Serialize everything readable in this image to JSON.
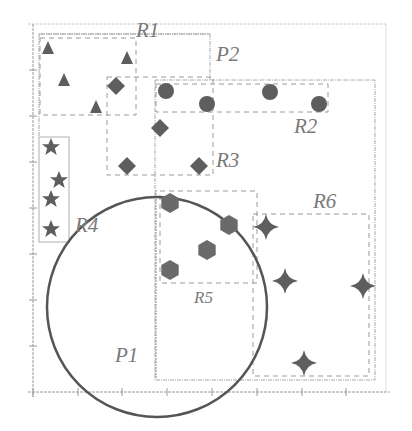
{
  "diagram": {
    "type": "spatial-partition",
    "colors": {
      "shape_fill": "#5e5e5e",
      "circle_stroke": "#555555",
      "dashed": "#9a9a9a",
      "axis": "#9a9a9a",
      "label": "#7a7a7a"
    },
    "labels": {
      "R1": "R1",
      "R2": "R2",
      "R3": "R3",
      "R4": "R4",
      "R5": "R5",
      "R6": "R6",
      "P1": "P1",
      "P2": "P2"
    },
    "regions": [
      {
        "id": "R1",
        "x": 40,
        "y": 38,
        "w": 96,
        "h": 77,
        "shape": "triangle"
      },
      {
        "id": "R2",
        "x": 156,
        "y": 84,
        "w": 172,
        "h": 28,
        "shape": "circle"
      },
      {
        "id": "R3",
        "x": 107,
        "y": 77,
        "w": 106,
        "h": 98,
        "shape": "diamond"
      },
      {
        "id": "R4",
        "x": 39,
        "y": 137,
        "w": 30,
        "h": 105,
        "shape": "star"
      },
      {
        "id": "R5",
        "x": 160,
        "y": 191,
        "w": 97,
        "h": 92,
        "shape": "hexagon"
      },
      {
        "id": "R6",
        "x": 253,
        "y": 214,
        "w": 116,
        "h": 162,
        "shape": "sparkle"
      }
    ],
    "partitions": [
      {
        "id": "P1",
        "shape": "circle",
        "cx": 157,
        "cy": 307,
        "r": 110
      },
      {
        "id": "P2",
        "x": 155,
        "y": 80,
        "w": 220,
        "h": 300
      }
    ],
    "points": {
      "triangles": [
        [
          48,
          47
        ],
        [
          64,
          80
        ],
        [
          96,
          107
        ],
        [
          127,
          58
        ]
      ],
      "diamonds": [
        [
          116,
          86
        ],
        [
          160,
          128
        ],
        [
          127,
          166
        ],
        [
          199,
          166
        ]
      ],
      "circles": [
        [
          166,
          91
        ],
        [
          207,
          104
        ],
        [
          270,
          92
        ],
        [
          319,
          104
        ]
      ],
      "stars": [
        [
          51,
          147
        ],
        [
          59,
          180
        ],
        [
          51,
          199
        ],
        [
          51,
          229
        ]
      ],
      "hexagons": [
        [
          170,
          203
        ],
        [
          229,
          225
        ],
        [
          207,
          250
        ],
        [
          170,
          270
        ]
      ],
      "sparkles": [
        [
          266,
          227
        ],
        [
          285,
          281
        ],
        [
          363,
          286
        ],
        [
          304,
          363
        ]
      ]
    }
  }
}
